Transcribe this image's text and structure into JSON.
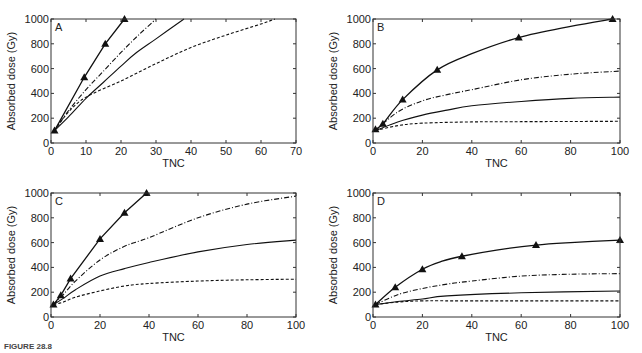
{
  "figure": {
    "caption_label": "FIGURE 28.8",
    "caption_text": "Time-course absorbed dose versus TNC (partially cut off)"
  },
  "chart_data": [
    {
      "panel": "A",
      "type": "line",
      "title": "",
      "xlabel": "TNC",
      "ylabel": "Absorbed dose (Gy)",
      "xlim": [
        0,
        70
      ],
      "ylim": [
        0,
        1000
      ],
      "xticks": [
        0,
        10,
        20,
        30,
        40,
        50,
        60,
        70
      ],
      "yticks": [
        0,
        200,
        400,
        600,
        800,
        1000
      ],
      "grid": false,
      "box": {
        "left": 51,
        "top": 19,
        "right": 296,
        "bottom": 143
      },
      "series": [
        {
          "name": "triangle-marker-solid",
          "style": "solid",
          "marker": "triangle",
          "x": [
            1,
            9.5,
            15.5,
            21
          ],
          "y": [
            100,
            530,
            800,
            1000
          ]
        },
        {
          "name": "dash-dot",
          "style": "dashdot",
          "marker": "none",
          "x": [
            1,
            5,
            10,
            15,
            20,
            25,
            30
          ],
          "y": [
            100,
            260,
            430,
            580,
            730,
            870,
            1000
          ]
        },
        {
          "name": "solid",
          "style": "solid",
          "marker": "none",
          "x": [
            1,
            5,
            10,
            15,
            20,
            24,
            30,
            38
          ],
          "y": [
            100,
            210,
            360,
            490,
            620,
            720,
            840,
            1000
          ]
        },
        {
          "name": "dashed",
          "style": "dashed",
          "marker": "none",
          "x": [
            1,
            5,
            10,
            20,
            30,
            40,
            50,
            60,
            64
          ],
          "y": [
            100,
            250,
            370,
            500,
            640,
            770,
            870,
            960,
            1000
          ]
        }
      ]
    },
    {
      "panel": "B",
      "type": "line",
      "title": "",
      "xlabel": "TNC",
      "ylabel": "Absorbed dose (Gy)",
      "xlim": [
        0,
        100
      ],
      "ylim": [
        0,
        1000
      ],
      "xticks": [
        0,
        20,
        40,
        60,
        80,
        100
      ],
      "yticks": [
        0,
        200,
        400,
        600,
        800,
        1000
      ],
      "grid": false,
      "box": {
        "left": 373,
        "top": 19,
        "right": 620,
        "bottom": 143
      },
      "series": [
        {
          "name": "triangle-marker-solid",
          "style": "solid",
          "marker": "triangle",
          "x": [
            1,
            4,
            12,
            26,
            40,
            59,
            80,
            97
          ],
          "y": [
            110,
            155,
            350,
            590,
            720,
            850,
            940,
            1000
          ],
          "marker_x": [
            1,
            4,
            12,
            26,
            59,
            97
          ],
          "marker_y": [
            110,
            155,
            350,
            590,
            850,
            1000
          ]
        },
        {
          "name": "dash-dot",
          "style": "dashdot",
          "marker": "none",
          "x": [
            1,
            10,
            20,
            30,
            40,
            60,
            80,
            100
          ],
          "y": [
            100,
            250,
            340,
            390,
            430,
            510,
            555,
            580
          ]
        },
        {
          "name": "solid",
          "style": "solid",
          "marker": "none",
          "x": [
            1,
            10,
            20,
            30,
            40,
            60,
            80,
            100
          ],
          "y": [
            100,
            170,
            225,
            265,
            300,
            335,
            360,
            370
          ]
        },
        {
          "name": "dashed",
          "style": "dashed",
          "marker": "none",
          "x": [
            1,
            10,
            20,
            40,
            60,
            100
          ],
          "y": [
            100,
            140,
            160,
            170,
            172,
            175
          ]
        }
      ]
    },
    {
      "panel": "C",
      "type": "line",
      "title": "",
      "xlabel": "TNC",
      "ylabel": "Absorbed dose (Gy)",
      "xlim": [
        0,
        100
      ],
      "ylim": [
        0,
        1000
      ],
      "xticks": [
        0,
        20,
        40,
        60,
        80,
        100
      ],
      "yticks": [
        0,
        200,
        400,
        600,
        800,
        1000
      ],
      "grid": false,
      "box": {
        "left": 51,
        "top": 193,
        "right": 296,
        "bottom": 317
      },
      "series": [
        {
          "name": "triangle-marker-solid",
          "style": "solid",
          "marker": "triangle",
          "x": [
            1,
            4,
            8,
            20,
            30,
            39
          ],
          "y": [
            100,
            175,
            310,
            630,
            840,
            1000
          ]
        },
        {
          "name": "dash-dot",
          "style": "dashdot",
          "marker": "none",
          "x": [
            1,
            5,
            10,
            20,
            30,
            40,
            60,
            80,
            100
          ],
          "y": [
            100,
            180,
            290,
            460,
            570,
            640,
            800,
            910,
            975
          ]
        },
        {
          "name": "solid",
          "style": "solid",
          "marker": "none",
          "x": [
            1,
            5,
            10,
            20,
            30,
            40,
            60,
            80,
            100
          ],
          "y": [
            100,
            150,
            220,
            330,
            390,
            440,
            525,
            585,
            620
          ]
        },
        {
          "name": "dashed",
          "style": "dashed",
          "marker": "none",
          "x": [
            1,
            5,
            10,
            20,
            30,
            40,
            60,
            80,
            100
          ],
          "y": [
            100,
            120,
            160,
            210,
            250,
            270,
            290,
            300,
            305
          ]
        }
      ]
    },
    {
      "panel": "D",
      "type": "line",
      "title": "",
      "xlabel": "TNC",
      "ylabel": "Absorbed dose (Gy)",
      "xlim": [
        0,
        100
      ],
      "ylim": [
        0,
        1000
      ],
      "xticks": [
        0,
        20,
        40,
        60,
        80,
        100
      ],
      "yticks": [
        0,
        200,
        400,
        600,
        800,
        1000
      ],
      "grid": false,
      "box": {
        "left": 373,
        "top": 193,
        "right": 620,
        "bottom": 317
      },
      "series": [
        {
          "name": "triangle-marker-solid",
          "style": "solid",
          "marker": "triangle",
          "x": [
            1,
            9,
            20,
            28,
            36,
            50,
            66,
            80,
            100
          ],
          "y": [
            100,
            240,
            385,
            450,
            490,
            540,
            580,
            600,
            620
          ],
          "marker_x": [
            1,
            9,
            20,
            36,
            66,
            100
          ],
          "marker_y": [
            100,
            240,
            385,
            490,
            580,
            620
          ]
        },
        {
          "name": "dash-dot",
          "style": "dashdot",
          "marker": "none",
          "x": [
            1,
            10,
            20,
            30,
            40,
            60,
            80,
            100
          ],
          "y": [
            100,
            180,
            230,
            265,
            290,
            330,
            345,
            350
          ]
        },
        {
          "name": "solid",
          "style": "solid",
          "marker": "none",
          "x": [
            1,
            10,
            20,
            30,
            60,
            100
          ],
          "y": [
            100,
            125,
            145,
            170,
            195,
            210
          ]
        },
        {
          "name": "dashed",
          "style": "dashed",
          "marker": "none",
          "x": [
            1,
            10,
            20,
            40,
            100
          ],
          "y": [
            100,
            120,
            130,
            130,
            130
          ]
        }
      ]
    }
  ]
}
